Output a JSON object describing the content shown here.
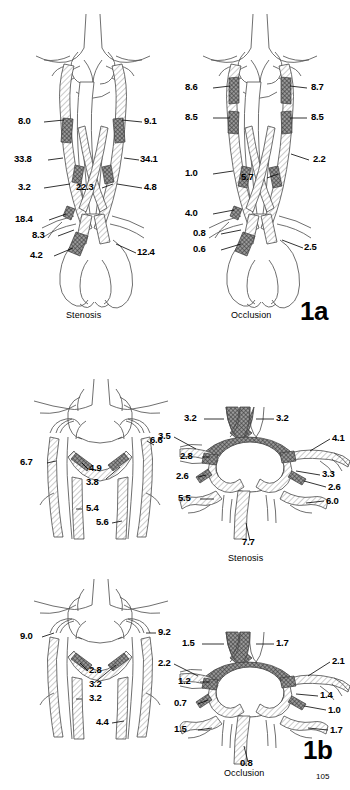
{
  "figure": {
    "page_number": "105",
    "parts": [
      {
        "id": "1a",
        "number_label": "1a",
        "panels": [
          {
            "id": "1a-stenosis",
            "caption": "Stenosis",
            "view": "anterior view of extracranial and intracranial arteries with aortic arch",
            "labels": [
              {
                "value": "8.0",
                "side": "left"
              },
              {
                "value": "33.8",
                "side": "left"
              },
              {
                "value": "3.2",
                "side": "left"
              },
              {
                "value": "18.4",
                "side": "left"
              },
              {
                "value": "8.3",
                "side": "left"
              },
              {
                "value": "4.2",
                "side": "left"
              },
              {
                "value": "22.3",
                "side": "center"
              },
              {
                "value": "9.1",
                "side": "right"
              },
              {
                "value": "34.1",
                "side": "right"
              },
              {
                "value": "4.8",
                "side": "right"
              },
              {
                "value": "12.4",
                "side": "right"
              }
            ]
          },
          {
            "id": "1a-occlusion",
            "caption": "Occlusion",
            "view": "anterior view of extracranial and intracranial arteries with aortic arch",
            "labels": [
              {
                "value": "8.6",
                "side": "left"
              },
              {
                "value": "8.5",
                "side": "left"
              },
              {
                "value": "1.0",
                "side": "left"
              },
              {
                "value": "4.0",
                "side": "left"
              },
              {
                "value": "0.8",
                "side": "left"
              },
              {
                "value": "0.6",
                "side": "left"
              },
              {
                "value": "5.7",
                "side": "center"
              },
              {
                "value": "8.7",
                "side": "right"
              },
              {
                "value": "8.5",
                "side": "right"
              },
              {
                "value": "2.2",
                "side": "right"
              },
              {
                "value": "2.5",
                "side": "right"
              }
            ]
          }
        ]
      },
      {
        "id": "1b",
        "number_label": "1b",
        "panels": [
          {
            "id": "1b-stenosis-vertebrobasilar",
            "caption": "",
            "view": "posterior view of vertebrobasilar system",
            "labels": [
              {
                "value": "6.7",
                "side": "left"
              },
              {
                "value": "4.9",
                "side": "center"
              },
              {
                "value": "3.8",
                "side": "center"
              },
              {
                "value": "5.4",
                "side": "center"
              },
              {
                "value": "5.6",
                "side": "center"
              },
              {
                "value": "6.6",
                "side": "right"
              }
            ]
          },
          {
            "id": "1b-stenosis-circle",
            "caption": "Stenosis",
            "view": "basal view of the circle of Willis",
            "labels": [
              {
                "value": "3.2",
                "side": "left"
              },
              {
                "value": "3.5",
                "side": "left"
              },
              {
                "value": "2.8",
                "side": "left"
              },
              {
                "value": "2.6",
                "side": "left"
              },
              {
                "value": "5.5",
                "side": "left"
              },
              {
                "value": "7.7",
                "side": "bottom"
              },
              {
                "value": "3.2",
                "side": "right"
              },
              {
                "value": "4.1",
                "side": "right"
              },
              {
                "value": "3.3",
                "side": "right"
              },
              {
                "value": "2.6",
                "side": "right"
              },
              {
                "value": "6.0",
                "side": "right"
              }
            ]
          },
          {
            "id": "1b-occlusion-vertebrobasilar",
            "caption": "",
            "view": "posterior view of vertebrobasilar system",
            "labels": [
              {
                "value": "9.0",
                "side": "left"
              },
              {
                "value": "2.8",
                "side": "center"
              },
              {
                "value": "3.2",
                "side": "center"
              },
              {
                "value": "3.2",
                "side": "center"
              },
              {
                "value": "4.4",
                "side": "center"
              },
              {
                "value": "9.2",
                "side": "right"
              }
            ]
          },
          {
            "id": "1b-occlusion-circle",
            "caption": "Occlusion",
            "view": "basal view of the circle of Willis",
            "labels": [
              {
                "value": "1.5",
                "side": "left"
              },
              {
                "value": "2.2",
                "side": "left"
              },
              {
                "value": "1.2",
                "side": "left"
              },
              {
                "value": "0.7",
                "side": "left"
              },
              {
                "value": "1.5",
                "side": "left"
              },
              {
                "value": "0.8",
                "side": "bottom"
              },
              {
                "value": "1.7",
                "side": "right"
              },
              {
                "value": "2.1",
                "side": "right"
              },
              {
                "value": "1.4",
                "side": "right"
              },
              {
                "value": "1.0",
                "side": "right"
              },
              {
                "value": "1.7",
                "side": "right"
              }
            ]
          }
        ]
      }
    ]
  },
  "colors": {
    "background": "#ffffff",
    "vessel_outline": "#4a4a4a",
    "lesion_fill": "#555555",
    "label_text": "#000000"
  }
}
